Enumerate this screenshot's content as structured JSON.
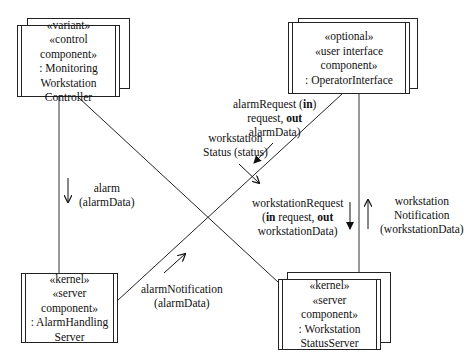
{
  "diagram": {
    "components": [
      {
        "id": "monitoring",
        "lines": [
          "«variant»",
          "«control component»",
          ": Monitoring",
          "Workstation",
          "Controller"
        ],
        "multiple": true
      },
      {
        "id": "operator",
        "lines": [
          "«optional»",
          "«user interface component»",
          ": OperatorInterface"
        ],
        "multiple": true
      },
      {
        "id": "alarm",
        "lines": [
          "«kernel»",
          "«server component»",
          ": AlarmHandling",
          "Server"
        ],
        "multiple": false
      },
      {
        "id": "wsserver",
        "lines": [
          "«kernel»",
          "«server component»",
          ": Workstation",
          "StatusServer"
        ],
        "multiple": true
      }
    ],
    "messages": {
      "workstation_status": [
        "workstation",
        "Status (status)"
      ],
      "alarm": [
        "alarm",
        "(alarmData)"
      ],
      "alarm_request": {
        "l1_a": "alarmRequest (",
        "l1_b": "in",
        "l2_a": "request, ",
        "l2_b": "out",
        "l3": "alarmData)"
      },
      "alarm_notification": [
        "alarmNotification",
        "(alarmData)"
      ],
      "workstation_request": {
        "l1": "workstationRequest",
        "l2_a": "(",
        "l2_b": "in",
        "l2_c": " request, ",
        "l2_d": "out",
        "l3": "workstationData)"
      },
      "workstation_notification": [
        "workstation",
        "Notification",
        "(workstationData)"
      ]
    }
  }
}
